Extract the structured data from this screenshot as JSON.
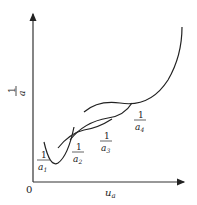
{
  "diagram": {
    "axes": {
      "origin_label": "0",
      "x_label": "u",
      "x_label_sub": "a",
      "y_label_num": "1",
      "y_label_den": "a"
    },
    "curves": [
      {
        "id": "a1",
        "label_num": "1",
        "label_den": "a",
        "label_sub": "1"
      },
      {
        "id": "a2",
        "label_num": "1",
        "label_den": "a",
        "label_sub": "2"
      },
      {
        "id": "a3",
        "label_num": "1",
        "label_den": "a",
        "label_sub": "3"
      },
      {
        "id": "a4",
        "label_num": "1",
        "label_den": "a",
        "label_sub": "4"
      }
    ],
    "colors": {
      "line": "#222222",
      "background": "#ffffff"
    }
  }
}
